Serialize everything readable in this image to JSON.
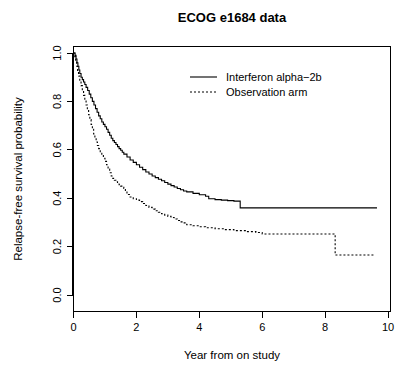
{
  "chart_data": {
    "type": "line",
    "title": "ECOG e1684 data",
    "xlabel": "Year from on study",
    "ylabel": "Relapse-free survival probability",
    "xlim": [
      0,
      10
    ],
    "ylim": [
      0,
      1
    ],
    "xticks": [
      "0",
      "2",
      "4",
      "6",
      "8",
      "10"
    ],
    "xtick_values": [
      0,
      2,
      4,
      6,
      8,
      10
    ],
    "yticks": [
      "0.0",
      "0.2",
      "0.4",
      "0.6",
      "0.8",
      "1.0"
    ],
    "ytick_values": [
      0,
      0.2,
      0.4,
      0.6,
      0.8,
      1.0
    ],
    "grid": false,
    "legend_position": "top-center",
    "series": [
      {
        "name": "Interferon alpha−2b",
        "style": "solid",
        "color": "#000000",
        "final_value": 0.36,
        "points": [
          [
            0.0,
            1.0
          ],
          [
            0.05,
            0.99
          ],
          [
            0.08,
            0.975
          ],
          [
            0.11,
            0.96
          ],
          [
            0.14,
            0.945
          ],
          [
            0.17,
            0.93
          ],
          [
            0.2,
            0.915
          ],
          [
            0.24,
            0.9
          ],
          [
            0.28,
            0.89
          ],
          [
            0.32,
            0.88
          ],
          [
            0.36,
            0.87
          ],
          [
            0.4,
            0.858
          ],
          [
            0.45,
            0.845
          ],
          [
            0.5,
            0.83
          ],
          [
            0.55,
            0.815
          ],
          [
            0.6,
            0.8
          ],
          [
            0.65,
            0.785
          ],
          [
            0.7,
            0.77
          ],
          [
            0.75,
            0.755
          ],
          [
            0.8,
            0.74
          ],
          [
            0.85,
            0.728
          ],
          [
            0.9,
            0.715
          ],
          [
            0.95,
            0.705
          ],
          [
            1.0,
            0.695
          ],
          [
            1.05,
            0.685
          ],
          [
            1.1,
            0.672
          ],
          [
            1.15,
            0.66
          ],
          [
            1.2,
            0.648
          ],
          [
            1.25,
            0.638
          ],
          [
            1.3,
            0.63
          ],
          [
            1.35,
            0.622
          ],
          [
            1.4,
            0.613
          ],
          [
            1.45,
            0.605
          ],
          [
            1.5,
            0.598
          ],
          [
            1.55,
            0.59
          ],
          [
            1.6,
            0.582
          ],
          [
            1.7,
            0.57
          ],
          [
            1.8,
            0.558
          ],
          [
            1.9,
            0.548
          ],
          [
            2.0,
            0.538
          ],
          [
            2.1,
            0.528
          ],
          [
            2.2,
            0.518
          ],
          [
            2.3,
            0.508
          ],
          [
            2.4,
            0.5
          ],
          [
            2.5,
            0.492
          ],
          [
            2.6,
            0.485
          ],
          [
            2.7,
            0.478
          ],
          [
            2.8,
            0.472
          ],
          [
            2.9,
            0.465
          ],
          [
            3.0,
            0.458
          ],
          [
            3.1,
            0.452
          ],
          [
            3.2,
            0.446
          ],
          [
            3.3,
            0.44
          ],
          [
            3.4,
            0.435
          ],
          [
            3.5,
            0.43
          ],
          [
            3.6,
            0.426
          ],
          [
            3.8,
            0.42
          ],
          [
            4.0,
            0.414
          ],
          [
            4.2,
            0.408
          ],
          [
            4.3,
            0.398
          ],
          [
            4.5,
            0.394
          ],
          [
            4.7,
            0.392
          ],
          [
            4.9,
            0.39
          ],
          [
            5.1,
            0.388
          ],
          [
            5.3,
            0.36
          ],
          [
            6.0,
            0.36
          ],
          [
            7.0,
            0.36
          ],
          [
            8.0,
            0.36
          ],
          [
            9.0,
            0.36
          ],
          [
            9.65,
            0.36
          ]
        ]
      },
      {
        "name": "Observation arm",
        "style": "dashed",
        "color": "#000000",
        "final_value": 0.165,
        "points": [
          [
            0.0,
            1.0
          ],
          [
            0.04,
            0.985
          ],
          [
            0.07,
            0.965
          ],
          [
            0.1,
            0.945
          ],
          [
            0.13,
            0.925
          ],
          [
            0.16,
            0.905
          ],
          [
            0.2,
            0.885
          ],
          [
            0.24,
            0.865
          ],
          [
            0.28,
            0.845
          ],
          [
            0.32,
            0.825
          ],
          [
            0.36,
            0.805
          ],
          [
            0.4,
            0.785
          ],
          [
            0.44,
            0.765
          ],
          [
            0.48,
            0.745
          ],
          [
            0.52,
            0.725
          ],
          [
            0.56,
            0.705
          ],
          [
            0.6,
            0.685
          ],
          [
            0.64,
            0.665
          ],
          [
            0.68,
            0.648
          ],
          [
            0.72,
            0.632
          ],
          [
            0.76,
            0.618
          ],
          [
            0.8,
            0.605
          ],
          [
            0.85,
            0.592
          ],
          [
            0.9,
            0.578
          ],
          [
            0.95,
            0.565
          ],
          [
            1.0,
            0.552
          ],
          [
            1.05,
            0.538
          ],
          [
            1.1,
            0.52
          ],
          [
            1.15,
            0.505
          ],
          [
            1.2,
            0.492
          ],
          [
            1.25,
            0.482
          ],
          [
            1.3,
            0.474
          ],
          [
            1.35,
            0.468
          ],
          [
            1.4,
            0.462
          ],
          [
            1.45,
            0.456
          ],
          [
            1.5,
            0.45
          ],
          [
            1.6,
            0.44
          ],
          [
            1.65,
            0.428
          ],
          [
            1.7,
            0.415
          ],
          [
            1.8,
            0.405
          ],
          [
            1.9,
            0.398
          ],
          [
            2.0,
            0.392
          ],
          [
            2.1,
            0.386
          ],
          [
            2.2,
            0.378
          ],
          [
            2.3,
            0.37
          ],
          [
            2.4,
            0.362
          ],
          [
            2.5,
            0.355
          ],
          [
            2.6,
            0.348
          ],
          [
            2.7,
            0.342
          ],
          [
            2.8,
            0.336
          ],
          [
            2.9,
            0.33
          ],
          [
            3.0,
            0.325
          ],
          [
            3.1,
            0.32
          ],
          [
            3.2,
            0.314
          ],
          [
            3.3,
            0.308
          ],
          [
            3.4,
            0.302
          ],
          [
            3.5,
            0.298
          ],
          [
            3.6,
            0.29
          ],
          [
            3.8,
            0.286
          ],
          [
            4.0,
            0.282
          ],
          [
            4.2,
            0.278
          ],
          [
            4.5,
            0.274
          ],
          [
            4.8,
            0.27
          ],
          [
            5.1,
            0.266
          ],
          [
            5.5,
            0.262
          ],
          [
            5.8,
            0.258
          ],
          [
            6.0,
            0.252
          ],
          [
            6.5,
            0.252
          ],
          [
            7.0,
            0.252
          ],
          [
            7.5,
            0.252
          ],
          [
            8.0,
            0.252
          ],
          [
            8.3,
            0.252
          ],
          [
            8.32,
            0.165
          ],
          [
            9.0,
            0.165
          ],
          [
            9.6,
            0.165
          ]
        ]
      }
    ]
  },
  "legend": {
    "items": [
      {
        "label": "Interferon alpha−2b",
        "style": "solid"
      },
      {
        "label": "Observation arm",
        "style": "dashed"
      }
    ]
  }
}
